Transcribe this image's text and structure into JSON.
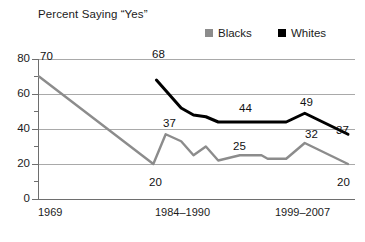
{
  "chart_data": {
    "type": "line",
    "title": "Percent Saying “Yes”",
    "xlabel": "",
    "ylabel": "",
    "ylim": [
      0,
      80
    ],
    "ytick_values": [
      0,
      20,
      40,
      60,
      80
    ],
    "ytick_labels": [
      "0",
      "20",
      "40",
      "60",
      "80"
    ],
    "yminor_values": [
      10,
      30,
      50,
      70
    ],
    "grid": true,
    "grid_axis": "y",
    "legend_position": "top-right",
    "xtick_labels": [
      "1969",
      "1984–1990",
      "1999–2007"
    ],
    "series": [
      {
        "name": "Blacks",
        "color": "#8c8c8c",
        "points": [
          {
            "x": 0,
            "y": 70
          },
          {
            "x": 37,
            "y": 20
          },
          {
            "x": 41,
            "y": 37
          },
          {
            "x": 46,
            "y": 33
          },
          {
            "x": 50,
            "y": 25
          },
          {
            "x": 54,
            "y": 30
          },
          {
            "x": 58,
            "y": 22
          },
          {
            "x": 65,
            "y": 25
          },
          {
            "x": 72,
            "y": 25
          },
          {
            "x": 74,
            "y": 23
          },
          {
            "x": 80,
            "y": 23
          },
          {
            "x": 86,
            "y": 32
          },
          {
            "x": 100,
            "y": 20
          }
        ],
        "labeled_points": [
          {
            "value": "70",
            "x": 0,
            "y": 70
          },
          {
            "value": "20",
            "x": 37,
            "y": 20
          },
          {
            "value": "37",
            "x": 41,
            "y": 37
          },
          {
            "value": "25",
            "x": 65,
            "y": 25
          },
          {
            "value": "32",
            "x": 86,
            "y": 32
          },
          {
            "value": "20",
            "x": 100,
            "y": 20
          }
        ]
      },
      {
        "name": "Whites",
        "color": "#000000",
        "points": [
          {
            "x": 38,
            "y": 68
          },
          {
            "x": 46,
            "y": 52
          },
          {
            "x": 50,
            "y": 48
          },
          {
            "x": 54,
            "y": 47
          },
          {
            "x": 58,
            "y": 44
          },
          {
            "x": 72,
            "y": 44
          },
          {
            "x": 80,
            "y": 44
          },
          {
            "x": 86,
            "y": 49
          },
          {
            "x": 100,
            "y": 37
          }
        ],
        "labeled_points": [
          {
            "value": "68",
            "x": 38,
            "y": 68
          },
          {
            "value": "44",
            "x": 66,
            "y": 44
          },
          {
            "value": "49",
            "x": 86,
            "y": 49
          },
          {
            "value": "37",
            "x": 100,
            "y": 37
          }
        ]
      }
    ]
  },
  "title": "Percent Saying “Yes”",
  "legend": {
    "items": [
      {
        "label": "Blacks",
        "color": "#8c8c8c",
        "swatch_name": "legend-swatch-blacks"
      },
      {
        "label": "Whites",
        "color": "#000000",
        "swatch_name": "legend-swatch-whites"
      }
    ]
  },
  "axis": {
    "y_labels": [
      "80",
      "60",
      "40",
      "20",
      "0"
    ],
    "x_labels": [
      "1969",
      "1984–1990",
      "1999–2007"
    ]
  },
  "labels": {
    "blacks_70": "70",
    "blacks_20_low": "20",
    "blacks_37": "37",
    "blacks_25": "25",
    "blacks_32": "32",
    "blacks_20_end": "20",
    "whites_68": "68",
    "whites_44": "44",
    "whites_49": "49",
    "whites_37": "37"
  }
}
